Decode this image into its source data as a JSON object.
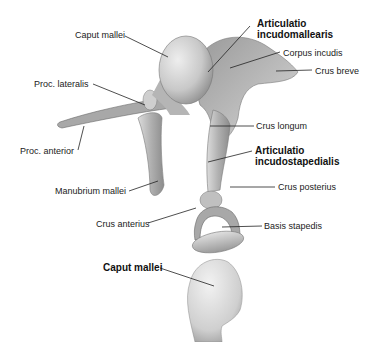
{
  "figure": {
    "upper_view": {
      "labels": [
        {
          "id": "caput-mallei",
          "text": "Caput mallei",
          "bold": false
        },
        {
          "id": "articulatio-incudomallearis-1",
          "text": "Articulatio",
          "bold": true
        },
        {
          "id": "articulatio-incudomallearis-2",
          "text": "incudomallearis",
          "bold": true
        },
        {
          "id": "corpus-incudis",
          "text": "Corpus incudis",
          "bold": false
        },
        {
          "id": "crus-breve",
          "text": "Crus breve",
          "bold": false
        },
        {
          "id": "proc-lateralis",
          "text": "Proc. lateralis",
          "bold": false
        },
        {
          "id": "crus-longum",
          "text": "Crus longum",
          "bold": false
        },
        {
          "id": "proc-anterior",
          "text": "Proc. anterior",
          "bold": false
        },
        {
          "id": "articulatio-incudostapedialis-1",
          "text": "Articulatio",
          "bold": true
        },
        {
          "id": "articulatio-incudostapedialis-2",
          "text": "incudostapedialis",
          "bold": true
        },
        {
          "id": "manubrium-mallei",
          "text": "Manubrium mallei",
          "bold": false
        },
        {
          "id": "crus-posterius",
          "text": "Crus posterius",
          "bold": false
        },
        {
          "id": "crus-anterius",
          "text": "Crus anterius",
          "bold": false
        },
        {
          "id": "basis-stapedis",
          "text": "Basis stapedis",
          "bold": false
        }
      ]
    },
    "lower_view": {
      "labels": [
        {
          "id": "caput-mallei-lower",
          "text": "Caput mallei",
          "bold": true
        }
      ]
    }
  }
}
